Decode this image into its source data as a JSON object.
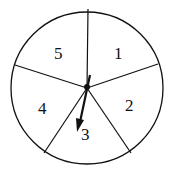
{
  "spinner": {
    "sectors": [
      {
        "label": "1",
        "x": 114,
        "y": 59
      },
      {
        "label": "2",
        "x": 125,
        "y": 111
      },
      {
        "label": "3",
        "x": 86,
        "y": 140
      },
      {
        "label": "4",
        "x": 41,
        "y": 114
      },
      {
        "label": "5",
        "x": 58,
        "y": 59
      }
    ],
    "pointer_target": "3",
    "colors": {
      "stroke": "#111111",
      "background": "#ffffff"
    }
  }
}
